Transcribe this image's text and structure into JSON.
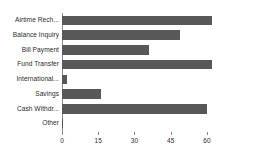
{
  "chart_data": {
    "type": "bar",
    "orientation": "horizontal",
    "title": "",
    "xlabel": "",
    "ylabel": "",
    "categories": [
      "Airtime Rech...",
      "Balance Inquiry",
      "Bill Payment",
      "Fund Transfer",
      "International...",
      "Savings",
      "Cash Withdr...",
      "Other"
    ],
    "values": [
      62,
      49,
      36,
      62,
      2,
      16,
      60,
      0.5
    ],
    "xticks": [
      0,
      15,
      30,
      45,
      60
    ],
    "xtick_labels": [
      "0",
      "15",
      "30",
      "45",
      "60"
    ],
    "xlim": [
      0,
      77
    ],
    "grid": false,
    "legend": null,
    "bar_color": "#585858",
    "axis_color": "#8a8a8a",
    "text_color": "#2b2b2b",
    "background": "#ffffff"
  }
}
